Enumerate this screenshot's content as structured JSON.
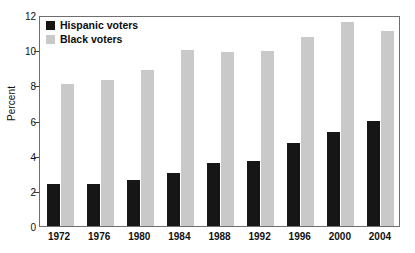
{
  "chart_data": {
    "type": "bar",
    "title": "",
    "subtitle": "",
    "xlabel": "",
    "ylabel": "Percent",
    "categories": [
      "1972",
      "1976",
      "1980",
      "1984",
      "1988",
      "1992",
      "1996",
      "2000",
      "2004"
    ],
    "series": [
      {
        "name": "Hispanic voters",
        "color": "#161616",
        "values": [
          2.4,
          2.4,
          2.6,
          3.0,
          3.6,
          3.7,
          4.7,
          5.35,
          6.0
        ]
      },
      {
        "name": "Black voters",
        "color": "#c9c9c9",
        "values": [
          8.1,
          8.3,
          8.85,
          10.0,
          9.9,
          9.95,
          10.75,
          11.6,
          11.1
        ]
      }
    ],
    "ylim": [
      0,
      12
    ],
    "yticks": [
      0,
      2,
      4,
      6,
      8,
      10,
      12
    ],
    "ytick_labels": [
      "0",
      "2",
      "4",
      "6",
      "8",
      "10",
      "12"
    ],
    "grid": false,
    "legend_position": "top-left-inside",
    "frame": true
  },
  "legend": {
    "items": [
      {
        "label": "Hispanic voters",
        "color": "#161616"
      },
      {
        "label": "Black voters",
        "color": "#c9c9c9"
      }
    ]
  },
  "axes": {
    "y_axis_title": "Percent"
  }
}
